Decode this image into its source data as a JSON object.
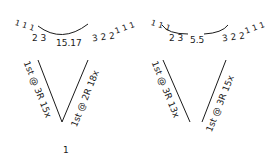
{
  "diagram": {
    "left": {
      "top_row": {
        "left_ticks": "1 1 1",
        "left_counts": "2 3",
        "center": "15.17",
        "right_counts": "3 2 2",
        "right_ticks": "1 1 1"
      },
      "left_arm": "1st @ 3R 15x",
      "right_arm": "1st @ 2R 18x",
      "bottom": "1"
    },
    "right": {
      "top_row": {
        "left_ticks": "1 1 1",
        "left_counts": "2 3",
        "center": "5.5",
        "right_counts": "3 2 2",
        "right_ticks": "1 1 1"
      },
      "left_arm": "1st @ 3R 13x",
      "right_arm": "1st @ 3R 15x"
    },
    "ink_color": "#1a1a1a",
    "background": "#ffffff"
  }
}
